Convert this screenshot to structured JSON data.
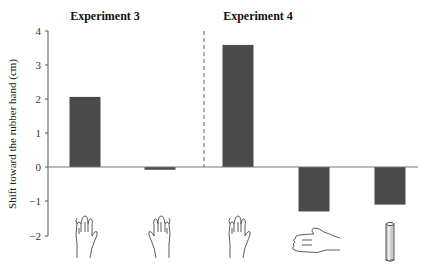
{
  "chart_data": {
    "type": "bar",
    "title": "",
    "panel_titles": [
      "Experiment 3",
      "Experiment 4"
    ],
    "xlabel": "",
    "ylabel": "Shift toward the rubber hand (cm)",
    "ylim": [
      -2,
      4
    ],
    "yticks": [
      4,
      3,
      2,
      1,
      0,
      -1,
      -2
    ],
    "grid": false,
    "legend": null,
    "categories": [
      "Exp3: congruent hand (palm down)",
      "Exp3: mirrored hand (palm down)",
      "Exp4: congruent hand (palm down)",
      "Exp4: hand rotated 90°",
      "Exp4: wooden stick"
    ],
    "category_icons": [
      "hand-upright-icon",
      "hand-upright-mirrored-icon",
      "hand-upright-icon",
      "hand-sideways-icon",
      "cylinder-stick-icon"
    ],
    "groups": [
      {
        "name": "Experiment 3",
        "category_indices": [
          0,
          1
        ]
      },
      {
        "name": "Experiment 4",
        "category_indices": [
          2,
          3,
          4
        ]
      }
    ],
    "values": [
      2.05,
      -0.08,
      3.57,
      -1.3,
      -1.1
    ],
    "bar_color": "#4a4a4a",
    "annotations": [
      "dashed vertical separator between Experiment 3 and Experiment 4"
    ]
  },
  "labels": {
    "panel1": "Experiment 3",
    "panel2": "Experiment 4",
    "ylabel": "Shift toward the rubber hand (cm)",
    "ticks": [
      "4",
      "3",
      "2",
      "1",
      "0",
      "−1",
      "−2"
    ]
  }
}
